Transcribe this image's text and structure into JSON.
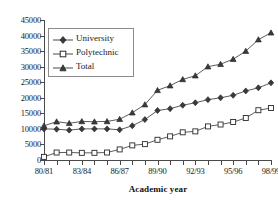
{
  "chart_data": {
    "type": "line",
    "title": "",
    "xlabel": "Academic year",
    "ylabel": "",
    "ylim": [
      0,
      45000
    ],
    "ytick_step": 5000,
    "yticks": [
      0,
      5000,
      10000,
      15000,
      20000,
      25000,
      30000,
      35000,
      40000,
      45000
    ],
    "ytick_labels": [
      "0",
      "5000",
      "10000",
      "15000",
      "20000",
      "25000",
      "30000",
      "35000",
      "40000",
      "45000"
    ],
    "grid": false,
    "legend_position": "upper left inside",
    "axes_style": "left and bottom spines only",
    "categories": [
      "80/81",
      "81/82",
      "82/83",
      "83/84",
      "84/85",
      "85/86",
      "86/87",
      "87/88",
      "88/89",
      "89/90",
      "90/91",
      "91/92",
      "92/93",
      "93/94",
      "94/95",
      "95/96",
      "96/97",
      "97/98",
      "98/99"
    ],
    "xtick_labels_shown": [
      "80/81",
      "83/84",
      "86/87",
      "89/90",
      "92/93",
      "95/96",
      "98/99"
    ],
    "xtick_label_interval": 3,
    "series": [
      {
        "name": "University",
        "marker": "diamond",
        "values": [
          10000,
          9900,
          9600,
          10000,
          10000,
          10000,
          9700,
          11000,
          13000,
          15900,
          16500,
          17600,
          18400,
          19400,
          20000,
          20800,
          22200,
          23200,
          24800
        ]
      },
      {
        "name": "Polytechnic",
        "marker": "square",
        "values": [
          1000,
          2400,
          2400,
          2300,
          2300,
          2400,
          3400,
          4700,
          5100,
          6500,
          7600,
          8900,
          9200,
          10800,
          11400,
          12200,
          13500,
          16000,
          16700
        ]
      },
      {
        "name": "Total",
        "marker": "triangle",
        "values": [
          11000,
          12300,
          11800,
          12400,
          12300,
          12400,
          13100,
          15200,
          17800,
          22400,
          23900,
          25900,
          27100,
          30000,
          30800,
          32400,
          35000,
          38700,
          40900
        ]
      }
    ]
  },
  "legend": {
    "items": [
      {
        "label": "University"
      },
      {
        "label": "Polytechnic"
      },
      {
        "label": "Total"
      }
    ]
  },
  "colors": {
    "line": "#4a4a4a",
    "marker_stroke": "#2a2a2a",
    "marker_fill_open": "#ffffff",
    "marker_fill_solid": "#3a3a3a",
    "axis": "#4a4a4a",
    "text": "#1a1a1a",
    "background": "#ffffff"
  }
}
